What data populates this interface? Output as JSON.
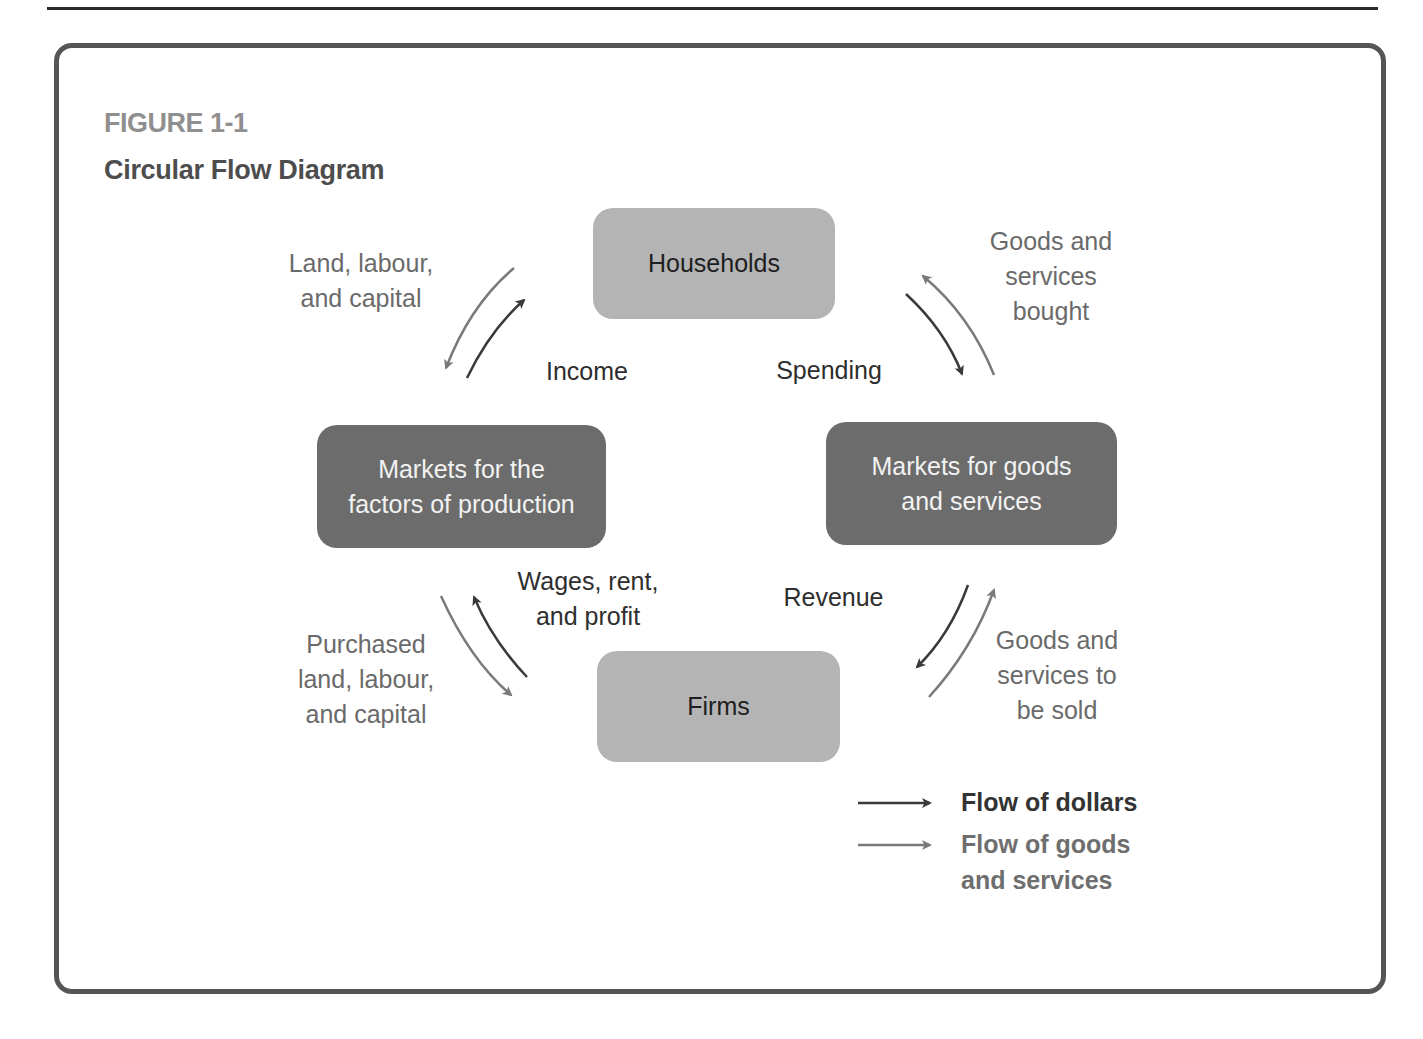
{
  "figure": {
    "label": "FIGURE 1-1",
    "title": "Circular Flow Diagram"
  },
  "nodes": {
    "households": "Households",
    "firms": "Firms",
    "factor_markets": "Markets for the\nfactors of production",
    "goods_markets": "Markets for goods\nand services"
  },
  "flows": {
    "land_labour_capital": "Land, labour,\nand capital",
    "income": "Income",
    "spending": "Spending",
    "goods_services_bought": "Goods and\nservices\nbought",
    "wages_rent_profit": "Wages, rent,\nand profit",
    "purchased_factors": "Purchased\nland, labour,\nand capital",
    "revenue": "Revenue",
    "goods_services_to_be_sold": "Goods and\nservices to\nbe sold"
  },
  "legend": {
    "dollars": "Flow of dollars",
    "goods": "Flow of goods\nand services"
  },
  "colors": {
    "dollars_arrow": "#3a3a3a",
    "goods_arrow": "#7a7a7a",
    "light_node": "#b4b4b4",
    "dark_node": "#6c6c6c",
    "frame": "#555555"
  }
}
